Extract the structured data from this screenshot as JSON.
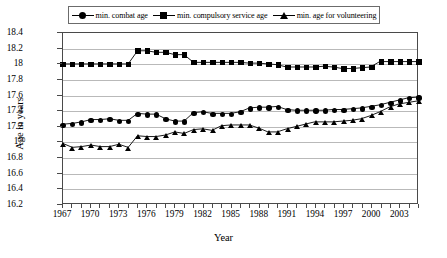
{
  "chart_data": {
    "type": "line",
    "title": "",
    "xlabel": "Year",
    "ylabel": "Age in years",
    "ylim": [
      16.2,
      18.4
    ],
    "ytick_step": 0.2,
    "yticks": [
      "18.4",
      "18.2",
      "18",
      "17.8",
      "17.6",
      "17.4",
      "17.2",
      "17",
      "16.8",
      "16.6",
      "16.4",
      "16.2"
    ],
    "xlim": [
      1967,
      2005
    ],
    "xticks_labeled": [
      "1967",
      "1970",
      "1973",
      "1976",
      "1979",
      "1982",
      "1985",
      "1988",
      "1991",
      "1994",
      "1997",
      "2000",
      "2003"
    ],
    "xtick_every": 1,
    "xtick_label_every": 3,
    "grid": "horizontal",
    "legend_position": "top-center",
    "x": [
      1967,
      1968,
      1969,
      1970,
      1971,
      1972,
      1973,
      1974,
      1975,
      1976,
      1977,
      1978,
      1979,
      1980,
      1981,
      1982,
      1983,
      1984,
      1985,
      1986,
      1987,
      1988,
      1989,
      1990,
      1991,
      1992,
      1993,
      1994,
      1995,
      1996,
      1997,
      1998,
      1999,
      2000,
      2001,
      2002,
      2003,
      2004,
      2005
    ],
    "series": [
      {
        "name": "min. combat age",
        "marker": "circle",
        "values": [
          17.22,
          17.23,
          17.25,
          17.28,
          17.28,
          17.29,
          17.27,
          17.27,
          17.36,
          17.35,
          17.35,
          17.29,
          17.26,
          17.26,
          17.37,
          17.38,
          17.36,
          17.36,
          17.36,
          17.38,
          17.43,
          17.44,
          17.44,
          17.45,
          17.41,
          17.4,
          17.4,
          17.4,
          17.4,
          17.41,
          17.41,
          17.42,
          17.43,
          17.45,
          17.47,
          17.5,
          17.53,
          17.56,
          17.57
        ]
      },
      {
        "name": "min. compulsory service age",
        "marker": "square",
        "values": [
          18.0,
          18.0,
          18.0,
          18.0,
          18.0,
          18.0,
          18.0,
          18.0,
          18.17,
          18.17,
          18.15,
          18.15,
          18.12,
          18.12,
          18.02,
          18.02,
          18.02,
          18.02,
          18.02,
          18.02,
          18.01,
          18.01,
          18.0,
          17.99,
          17.96,
          17.96,
          17.96,
          17.96,
          17.97,
          17.96,
          17.94,
          17.94,
          17.95,
          17.96,
          18.03,
          18.03,
          18.03,
          18.03,
          18.03
        ]
      },
      {
        "name": "min. age for volunteering",
        "marker": "triangle",
        "values": [
          16.97,
          16.92,
          16.93,
          16.95,
          16.93,
          16.93,
          16.96,
          16.92,
          17.07,
          17.06,
          17.06,
          17.08,
          17.12,
          17.1,
          17.15,
          17.16,
          17.14,
          17.2,
          17.21,
          17.21,
          17.21,
          17.17,
          17.12,
          17.12,
          17.16,
          17.19,
          17.22,
          17.25,
          17.25,
          17.25,
          17.26,
          17.27,
          17.29,
          17.33,
          17.38,
          17.44,
          17.48,
          17.5,
          17.52
        ]
      }
    ]
  },
  "legend": {
    "entries": [
      {
        "label": "min. combat age",
        "marker": "circle"
      },
      {
        "label": "min. compulsory service age",
        "marker": "square"
      },
      {
        "label": "min. age for volunteering",
        "marker": "triangle"
      }
    ]
  },
  "colors": {
    "series": "#000000",
    "grid": "#b9b9b9",
    "axis": "#4a4a4a",
    "background": "#ffffff"
  }
}
